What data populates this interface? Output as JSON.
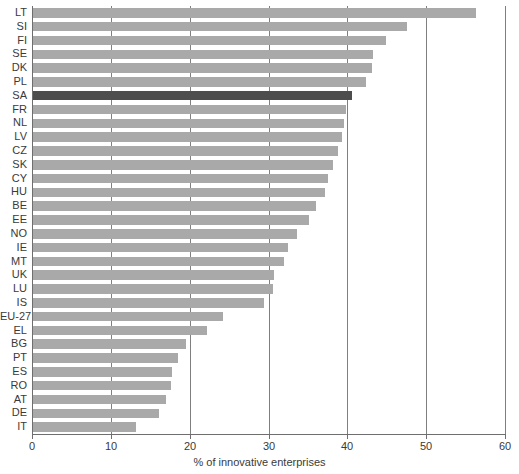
{
  "chart_data": {
    "type": "bar",
    "orientation": "horizontal",
    "title": "",
    "xlabel": "% of innovative enterprises",
    "ylabel": "",
    "xlim": [
      0,
      60
    ],
    "xticks": [
      0,
      10,
      20,
      30,
      40,
      50,
      60
    ],
    "grid": true,
    "legend": "none",
    "highlight_category": "SA",
    "colors": {
      "bar": "#a9a9a9",
      "highlight_bar": "#4d4d4d",
      "axis": "#6e6e6e",
      "text": "#3a3a3a",
      "background": "#ffffff"
    },
    "categories": [
      "LT",
      "SI",
      "FI",
      "SE",
      "DK",
      "PL",
      "SA",
      "FR",
      "NL",
      "LV",
      "CZ",
      "SK",
      "CY",
      "HU",
      "BE",
      "EE",
      "NO",
      "IE",
      "MT",
      "UK",
      "LU",
      "IS",
      "EU-27",
      "EL",
      "BG",
      "PT",
      "ES",
      "RO",
      "AT",
      "DE",
      "IT"
    ],
    "values": [
      56.2,
      47.5,
      44.8,
      43.1,
      43.0,
      42.3,
      40.5,
      39.7,
      39.5,
      39.2,
      38.7,
      38.1,
      37.4,
      37.1,
      35.9,
      35.0,
      33.5,
      32.3,
      31.8,
      30.6,
      30.4,
      29.3,
      24.1,
      22.1,
      19.4,
      18.4,
      17.6,
      17.5,
      16.9,
      16.0,
      13.1
    ]
  }
}
